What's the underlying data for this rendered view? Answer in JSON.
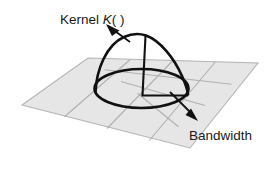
{
  "figure": {
    "background_color": "#ffffff",
    "labels": {
      "kernel": {
        "prefix": "Kernel ",
        "symbol": "K",
        "suffix": "( )",
        "full_text": "Kernel K( )"
      },
      "bandwidth": {
        "text": "Bandwidth"
      }
    },
    "colors": {
      "plane_fill": "#e6e6e6",
      "grid_line": "#b0b0b0",
      "kernel_stroke": "#111111",
      "text": "#1a1a1a"
    },
    "geometry": {
      "plane": {
        "shape": "parallelogram",
        "corner_top": [
          88,
          58
        ],
        "corner_right": [
          258,
          63
        ],
        "corner_bottom": [
          190,
          148
        ],
        "corner_left": [
          22,
          105
        ],
        "grid_divisions_u": 4,
        "grid_divisions_v": 4
      },
      "kernel": {
        "shape": "bell-dome",
        "apex": [
          145,
          35
        ],
        "base_center": [
          141,
          88
        ],
        "base_radius_x": 47,
        "base_radius_y": 19,
        "height_px": 53
      },
      "axis": {
        "vertical_from": [
          145,
          35
        ],
        "vertical_to": [
          142,
          95
        ],
        "radius_from": [
          142,
          95
        ],
        "radius_to": [
          188,
          95
        ]
      },
      "kernel_arrow": {
        "from": [
          112,
          28
        ],
        "to": [
          134,
          43
        ]
      },
      "bandwidth_arrow": {
        "from": [
          170,
          92
        ],
        "to": [
          196,
          118
        ]
      }
    }
  }
}
